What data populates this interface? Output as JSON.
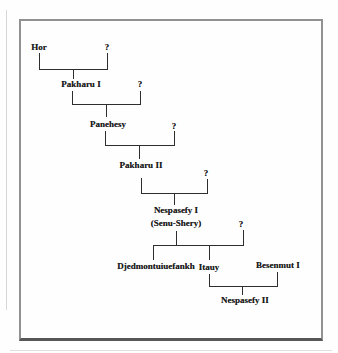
{
  "figure": {
    "type": "genealogy-family-tree",
    "people": {
      "hor": "Hor",
      "spouse1": "?",
      "pakharu_i": "Pakharu I",
      "spouse2": "?",
      "panehesy": "Panehesy",
      "spouse3": "?",
      "pakharu_ii": "Pakharu II",
      "spouse4": "?",
      "nespasefy_i": "Nespasefy I",
      "nespasefy_i_alias": "(Senu-Shery)",
      "spouse5": "?",
      "djedmontuiuefankh": "Djedmontuiuefankh",
      "itauy": "Itauy",
      "besenmut_i": "Besenmut I",
      "nespasefy_ii": "Nespasefy II"
    },
    "relations": [
      {
        "parents": [
          "Hor",
          "?"
        ],
        "children": [
          "Pakharu I"
        ]
      },
      {
        "parents": [
          "Pakharu I",
          "?"
        ],
        "children": [
          "Panehesy"
        ]
      },
      {
        "parents": [
          "Panehesy",
          "?"
        ],
        "children": [
          "Pakharu II"
        ]
      },
      {
        "parents": [
          "Pakharu II",
          "?"
        ],
        "children": [
          "Nespasefy I (Senu-Shery)"
        ]
      },
      {
        "parents": [
          "Nespasefy I (Senu-Shery)",
          "?"
        ],
        "children": [
          "Djedmontuiuefankh",
          "Itauy"
        ]
      },
      {
        "parents": [
          "Itauy",
          "Besenmut I"
        ],
        "children": [
          "Nespasefy II"
        ]
      }
    ],
    "colors": {
      "ink": "#1a1a1a",
      "line": "#2e2e2e",
      "frame_border": "#919191",
      "background": "#fefefe"
    }
  }
}
